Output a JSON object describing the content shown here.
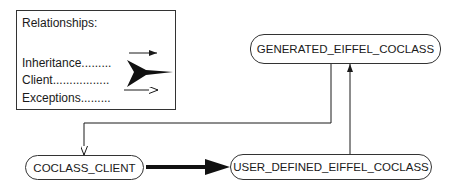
{
  "legend": {
    "title": "Relationships:",
    "items": [
      {
        "label": "Inheritance.........",
        "arrow": "thin-solid-arrow"
      },
      {
        "label": "Client.................",
        "arrow": "thick-solid-arrow"
      },
      {
        "label": "Exceptions.........",
        "arrow": "open-head-arrow"
      }
    ]
  },
  "nodes": {
    "generated": "GENERATED_EIFFEL_COCLASS",
    "client": "COCLASS_CLIENT",
    "user_defined": "USER_DEFINED_EIFFEL_COCLASS"
  },
  "edges": [
    {
      "from": "user_defined",
      "to": "generated",
      "type": "inheritance"
    },
    {
      "from": "client",
      "to": "user_defined",
      "type": "client"
    },
    {
      "from": "generated",
      "to": "client",
      "type": "exception"
    }
  ]
}
